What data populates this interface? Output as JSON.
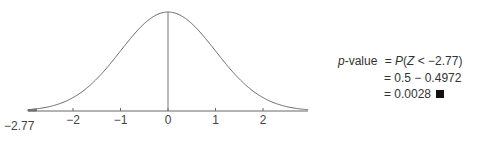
{
  "chart_data": {
    "type": "line",
    "title": "",
    "xlabel": "",
    "ylabel": "",
    "distribution": "standard normal",
    "xlim": [
      -2.95,
      2.95
    ],
    "x_ticks": [
      -2,
      -1,
      0,
      1,
      2
    ],
    "x_tick_labels": [
      "−2",
      "−1",
      "0",
      "1",
      "2"
    ],
    "vertical_line_at": 0,
    "marked_value": -2.77,
    "marked_value_label": "−2.77",
    "shaded_region": "Z < -2.77",
    "grid": false,
    "legend": null
  },
  "equation": {
    "lhs_italic": "p",
    "lhs_rest": "-value",
    "line1": "= P(Z < −2.77)",
    "line1_prefix": "= ",
    "line1_expr_P": "P",
    "line1_expr_open": "(",
    "line1_expr_Z": "Z",
    "line1_expr_rest": " < −2.77)",
    "line2": "= 0.5 − 0.4972",
    "line3": "= 0.0028",
    "end_marker": "qed-square"
  }
}
